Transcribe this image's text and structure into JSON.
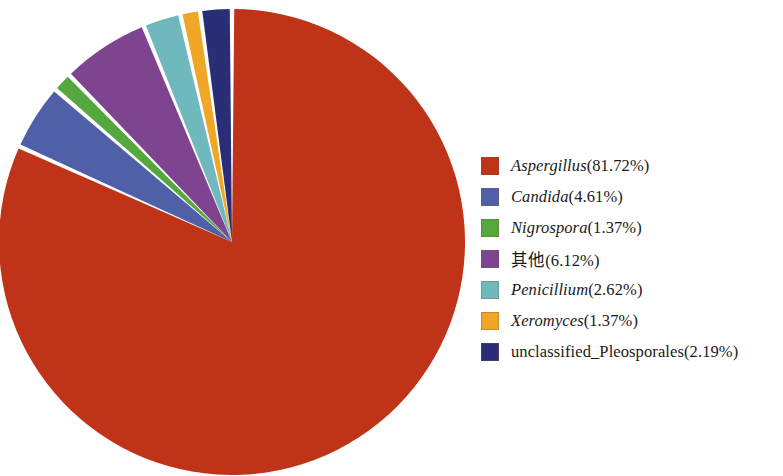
{
  "chart_data": {
    "type": "pie",
    "title": "",
    "subtitle": "",
    "xlabel": "",
    "ylabel": "",
    "legend_position": "right",
    "grid": false,
    "units": "percent",
    "start_angle_deg": 90,
    "direction": "clockwise_for_first_slice",
    "categories": [
      "Aspergillus",
      "Candida",
      "Nigrospora",
      "其他",
      "Penicillium",
      "Xeromyces",
      "unclassified_Pleosporales"
    ],
    "values": [
      81.72,
      4.61,
      1.37,
      6.12,
      2.62,
      1.37,
      2.19
    ],
    "value_labels": [
      "81.72%",
      "4.61%",
      "1.37%",
      "6.12%",
      "2.62%",
      "1.37%",
      "2.19%"
    ],
    "colors": [
      "#bf3318",
      "#4f5fa8",
      "#55a83e",
      "#7f4490",
      "#6fb8be",
      "#f0a626",
      "#2a2e77"
    ],
    "slice_gap_deg": 1.1,
    "geometry": {
      "center_x": 232,
      "center_y": 242,
      "radius": 233
    }
  },
  "legend": {
    "items": [
      {
        "name": "Aspergillus",
        "percent": "(81.72%)",
        "color": "#bf3318",
        "italic": true,
        "swatch_name": "legend-swatch-aspergillus"
      },
      {
        "name": "Candida",
        "percent": "(4.61%)",
        "color": "#4f5fa8",
        "italic": true,
        "swatch_name": "legend-swatch-candida"
      },
      {
        "name": "Nigrospora",
        "percent": "(1.37%)",
        "color": "#55a83e",
        "italic": true,
        "swatch_name": "legend-swatch-nigrospora"
      },
      {
        "name": "其他",
        "percent": "(6.12%)",
        "color": "#7f4490",
        "italic": false,
        "swatch_name": "legend-swatch-qita"
      },
      {
        "name": "Penicillium",
        "percent": "(2.62%)",
        "color": "#6fb8be",
        "italic": true,
        "swatch_name": "legend-swatch-penicillium"
      },
      {
        "name": "Xeromyces",
        "percent": "(1.37%)",
        "color": "#f0a626",
        "italic": true,
        "swatch_name": "legend-swatch-xeromyces"
      },
      {
        "name": "unclassified_Pleosporales",
        "percent": "(2.19%)",
        "color": "#2a2e77",
        "italic": false,
        "swatch_name": "legend-swatch-unclassified-pleosporales"
      }
    ]
  }
}
